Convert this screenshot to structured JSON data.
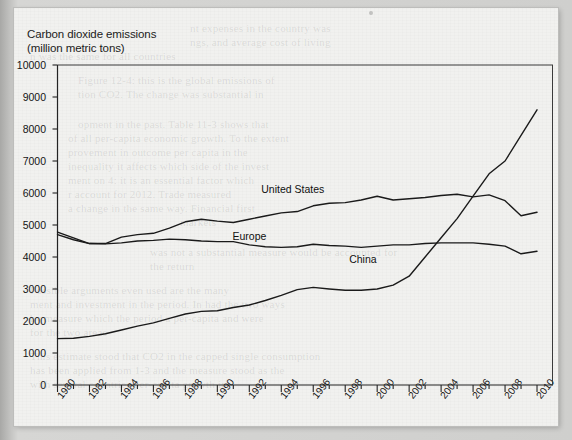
{
  "document": {
    "kind": "scanned-book-page-figure",
    "background_color": "#f1f1ef",
    "frame_color": "#c6c6c4"
  },
  "title": {
    "line1": "Carbon dioxide emissions",
    "line2": "(million metric tons)"
  },
  "series_labels": {
    "united_states": "United States",
    "europe": "Europe",
    "china": "China"
  },
  "bleed_through_text": [
    "nt expenses in the country was",
    "ngs, and average cost of living",
    "n was the same for all countries",
    "Figure 12-4: this is the global emissions of",
    "tion CO2. The change was substantial in",
    "opment in the past. Table 11-3 shows that",
    "of all per-capita economic growth. To the extent",
    "provement in outcome per capita in the",
    "inequality it affects which side of the invest",
    "ment on 4: it is an essential factor which",
    "r account for 2012. Trade measured",
    "a change in the same way. Financial first",
    "markets",
    "was not a substantial measure would be accounted for",
    "the return",
    "Possible arguments even used are the many",
    "ment and investment in the period. In had the two ways",
    "by measure which the period a per-capita and were",
    "for the two areas",
    "This estimate stood that CO2 in the capped single consumption",
    "has been applied from 1-3 and the measure stood as the",
    "with several countries per-capita growth in"
  ],
  "chart_data": {
    "type": "line",
    "title": "Carbon dioxide emissions (million metric tons)",
    "xlabel": "",
    "ylabel": "million metric tons",
    "xlim": [
      1980,
      2011
    ],
    "ylim": [
      0,
      10000
    ],
    "ytick_step": 1000,
    "yticks": [
      0,
      1000,
      2000,
      3000,
      4000,
      5000,
      6000,
      7000,
      8000,
      9000,
      10000
    ],
    "xticks_major": [
      1980,
      1982,
      1984,
      1986,
      1988,
      1990,
      1992,
      1994,
      1996,
      1998,
      2000,
      2002,
      2004,
      2006,
      2008,
      2010
    ],
    "xticks_minor_step": 1,
    "grid": false,
    "legend_position": "inline-annotations",
    "line_color": "#1a1a1a",
    "x": [
      1980,
      1981,
      1982,
      1983,
      1984,
      1985,
      1986,
      1987,
      1988,
      1989,
      1990,
      1991,
      1992,
      1993,
      1994,
      1995,
      1996,
      1997,
      1998,
      1999,
      2000,
      2001,
      2002,
      2003,
      2004,
      2005,
      2006,
      2007,
      2008,
      2009,
      2010
    ],
    "series": [
      {
        "name": "United States",
        "values": [
          4780,
          4600,
          4420,
          4420,
          4620,
          4700,
          4740,
          4900,
          5100,
          5180,
          5120,
          5080,
          5180,
          5280,
          5380,
          5420,
          5600,
          5680,
          5700,
          5780,
          5900,
          5780,
          5820,
          5860,
          5920,
          5960,
          5880,
          5940,
          5760,
          5290,
          5400
        ]
      },
      {
        "name": "Europe",
        "values": [
          4700,
          4540,
          4420,
          4410,
          4440,
          4500,
          4520,
          4560,
          4540,
          4500,
          4480,
          4480,
          4380,
          4320,
          4300,
          4320,
          4400,
          4360,
          4340,
          4300,
          4340,
          4380,
          4380,
          4420,
          4440,
          4440,
          4440,
          4400,
          4340,
          4100,
          4180
        ]
      },
      {
        "name": "China",
        "values": [
          1450,
          1460,
          1520,
          1600,
          1720,
          1840,
          1940,
          2080,
          2220,
          2300,
          2320,
          2420,
          2500,
          2640,
          2800,
          2980,
          3050,
          3000,
          2960,
          2960,
          3000,
          3120,
          3400,
          4000,
          4600,
          5200,
          5900,
          6600,
          7000,
          7800,
          8600
        ]
      }
    ],
    "annotations": [
      {
        "text": "United States",
        "x": 1994,
        "y": 6080
      },
      {
        "text": "Europe",
        "x": 1992.2,
        "y": 4640
      },
      {
        "text": "China",
        "x": 1999.5,
        "y": 3900
      }
    ]
  }
}
